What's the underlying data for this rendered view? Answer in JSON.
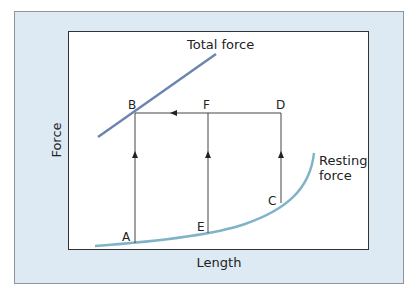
{
  "diagram": {
    "x_axis_label": "Length",
    "y_axis_label": "Force",
    "curves": [
      {
        "name": "Total force",
        "label": "Total force",
        "color": "#6b84b0"
      },
      {
        "name": "Resting force",
        "label_line1": "Resting",
        "label_line2": "force",
        "color": "#7fb3c7"
      }
    ],
    "points": {
      "A": "A",
      "B": "B",
      "C": "C",
      "D": "D",
      "E": "E",
      "F": "F"
    },
    "colors": {
      "panel_background": "#dde9f3",
      "plot_background": "#ffffff",
      "path_lines": "#444444"
    }
  }
}
